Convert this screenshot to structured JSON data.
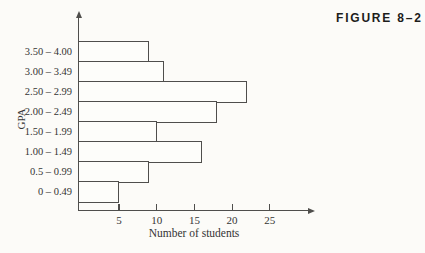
{
  "figure": {
    "label": "FIGURE 8–2"
  },
  "chart_data": {
    "type": "bar",
    "orientation": "horizontal",
    "title": "",
    "categories": [
      "3.50 – 4.00",
      "3.00 – 3.49",
      "2.50 – 2.99",
      "2.00 – 2.49",
      "1.50 – 1.99",
      "1.00 – 1.49",
      "0.5 – 0.99",
      "0 – 0.49"
    ],
    "values": [
      9,
      11,
      22,
      18,
      10,
      16,
      9,
      5
    ],
    "xlabel": "Number of students",
    "ylabel": "GPA",
    "x_ticks": [
      5,
      10,
      15,
      20,
      25
    ],
    "xlim": [
      0,
      30
    ],
    "grid": false,
    "legend": false,
    "colors": {
      "background": "#fcfbf8",
      "line": "#4f4e4c",
      "bar_fill": "#fdfdfa",
      "text": "#343434",
      "figure_label": "#1d1d1b"
    }
  }
}
